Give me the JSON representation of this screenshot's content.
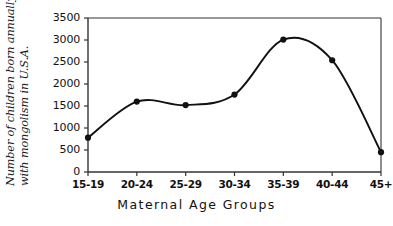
{
  "chart_data": {
    "type": "line",
    "title": "",
    "xlabel": "Maternal Age Groups",
    "ylabel": "Number of children born annually with mongolism in U.S.A.",
    "ylabel_line1": "Number of children born annually",
    "ylabel_line2": "with mongolism in U.S.A.",
    "categories": [
      "15-19",
      "20-24",
      "25-29",
      "30-34",
      "35-39",
      "40-44",
      "45+"
    ],
    "values": [
      780,
      1600,
      1520,
      1760,
      3010,
      2540,
      450
    ],
    "ylim": [
      0,
      3500
    ],
    "yticks": [
      "0",
      "500",
      "1000",
      "1500",
      "2000",
      "2500",
      "3000",
      "3500"
    ],
    "ytick_values": [
      0,
      500,
      1000,
      1500,
      2000,
      2500,
      3000,
      3500
    ],
    "grid": false,
    "legend": "none",
    "marker": "filled-circle",
    "line_color": "#111111",
    "marker_color": "#111111",
    "axis_color": "#333333",
    "background_color": "#ffffff"
  }
}
